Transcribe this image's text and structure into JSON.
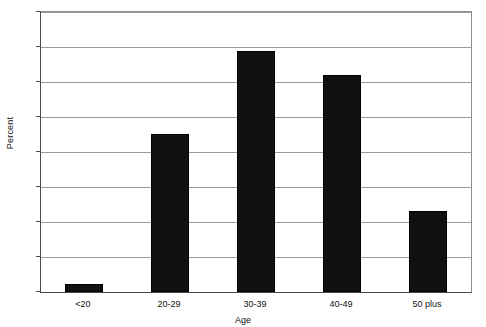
{
  "chart_data": {
    "type": "bar",
    "title": "",
    "xlabel": "Age",
    "ylabel": "Percent",
    "categories": [
      "<20",
      "20-29",
      "30-39",
      "40-49",
      "50 plus"
    ],
    "values": [
      1.1,
      22.6,
      34.4,
      31.0,
      11.6
    ],
    "ylim": [
      0,
      40
    ],
    "yticks": [
      0,
      5,
      10,
      15,
      20,
      25,
      30,
      35,
      40
    ],
    "ytick_labels": [
      "0",
      "5",
      "10",
      "15",
      "20",
      "25",
      "30",
      "35",
      "40"
    ],
    "grid": true,
    "legend": "none",
    "bar_color": "#111111",
    "grid_color": "#9a9a9a",
    "axis_color": "#4a4a4a",
    "background": "#ffffff"
  }
}
